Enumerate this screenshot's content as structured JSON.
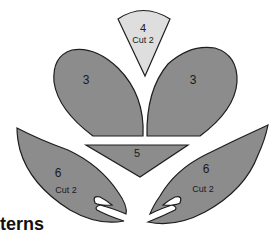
{
  "title": "terns",
  "colors": {
    "dark_piece": "#8c8c8c",
    "light_piece": "#dedede",
    "outline": "#1e1e1e"
  },
  "pieces": [
    {
      "id": "piece-4",
      "number": "4",
      "note": "Cut 2"
    },
    {
      "id": "piece-3-left",
      "number": "3"
    },
    {
      "id": "piece-3-right",
      "number": "3"
    },
    {
      "id": "piece-5",
      "number": "5"
    },
    {
      "id": "piece-6-left",
      "number": "6",
      "note": "Cut 2"
    },
    {
      "id": "piece-6-right",
      "number": "6",
      "note": "Cut 2"
    }
  ]
}
